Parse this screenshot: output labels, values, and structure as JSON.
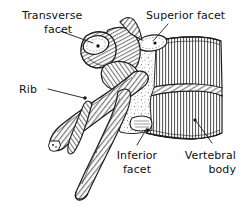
{
  "figure": {
    "background_color": "#ffffff",
    "ink_color": "#1d1d1d",
    "width": 250,
    "height": 209
  },
  "labels": {
    "transverse_facet": {
      "line1": "Transverse",
      "line2": "facet",
      "align": "center",
      "x": 10,
      "y": 8
    },
    "superior_facet": {
      "line1": "Superior facet",
      "line2": "",
      "align": "left",
      "x": 146,
      "y": 8
    },
    "rib": {
      "line1": "Rib",
      "line2": "",
      "align": "left",
      "x": 19,
      "y": 82
    },
    "inferior_facet": {
      "line1": "Inferior",
      "line2": "facet",
      "align": "center",
      "x": 112,
      "y": 148
    },
    "vertebral_body": {
      "line1": "Vertebral",
      "line2": "body",
      "align": "right",
      "x": 180,
      "y": 148
    }
  },
  "structures": [
    {
      "name": "transverse-process",
      "description": "Rounded knob at upper left bearing the costal (transverse) facet"
    },
    {
      "name": "superior-articular-facet",
      "description": "Oval facet on upper posterior margin of the vertebra"
    },
    {
      "name": "rib",
      "description": "Curved rib shaft sweeping down and to the left with diagonal hatching"
    },
    {
      "name": "inferior-articular-facet",
      "description": "Facet on the lower posterior margin of the vertebral arch"
    },
    {
      "name": "vertebral-body",
      "description": "Vertically hatched cylindrical body at right"
    },
    {
      "name": "intervertebral-disc",
      "description": "Obliquely hatched band crossing the vertebral body"
    },
    {
      "name": "spinous-process",
      "description": "Long process projecting down and to the left"
    },
    {
      "name": "pedicle-region",
      "description": "Stippled bone between body and arch"
    }
  ]
}
